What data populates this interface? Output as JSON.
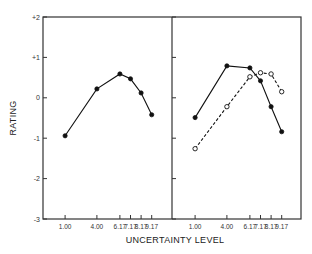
{
  "chart_data": {
    "type": "line",
    "ylabel": "RATING",
    "xlabel": "UNCERTAINTY LEVEL",
    "ylim": [
      -3,
      2
    ],
    "yticks": [
      2,
      1,
      0,
      -1,
      -2,
      -3
    ],
    "ytick_labels": [
      "+2",
      "+1",
      "0",
      "-1",
      "-2",
      "-3"
    ],
    "x": [
      1.0,
      4.0,
      6.17,
      7.17,
      8.17,
      9.17
    ],
    "xtick_labels": [
      "1.00",
      "4.00",
      "6.17",
      "7.17",
      "8.17",
      "9.17"
    ],
    "grid": false,
    "panels": [
      {
        "name": "left",
        "series": [
          {
            "name": "filled",
            "marker": "filled-circle",
            "style": "solid",
            "values": [
              -0.94,
              0.22,
              0.59,
              0.47,
              0.12,
              -0.42
            ]
          }
        ]
      },
      {
        "name": "right",
        "series": [
          {
            "name": "filled",
            "marker": "filled-circle",
            "style": "solid",
            "values": [
              -0.49,
              0.79,
              0.74,
              0.42,
              -0.22,
              -0.84
            ]
          },
          {
            "name": "open",
            "marker": "open-circle",
            "style": "dashed",
            "values": [
              -1.26,
              -0.22,
              0.52,
              0.62,
              0.59,
              0.15
            ]
          }
        ]
      }
    ]
  }
}
